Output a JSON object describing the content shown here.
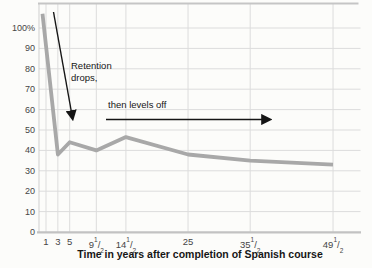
{
  "chart_data": {
    "type": "line",
    "title": "",
    "xlabel": "Time in years after completion of Spanish course",
    "ylabel": "",
    "series": [
      {
        "name": "Percentage of original vocabulary retained",
        "points": [
          {
            "x": 0.4,
            "y": 107
          },
          {
            "x": 3,
            "y": 38
          },
          {
            "x": 5,
            "y": 44
          },
          {
            "x": 9.5,
            "y": 40
          },
          {
            "x": 14.5,
            "y": 46.5
          },
          {
            "x": 25,
            "y": 38
          },
          {
            "x": 35.5,
            "y": 35
          },
          {
            "x": 49.5,
            "y": 33
          }
        ]
      }
    ],
    "x_ticks": [
      {
        "v": 1,
        "label": "1"
      },
      {
        "v": 3,
        "label": "3"
      },
      {
        "v": 5,
        "label": "5"
      },
      {
        "v": 9.5,
        "label": "9 1/2"
      },
      {
        "v": 14.5,
        "label": "14 1/2"
      },
      {
        "v": 25,
        "label": "25"
      },
      {
        "v": 35.5,
        "label": "35 1/2"
      },
      {
        "v": 49.5,
        "label": "49 1/2"
      }
    ],
    "y_ticks": [
      {
        "v": 100,
        "label": "100%"
      },
      {
        "v": 90,
        "label": "90"
      },
      {
        "v": 80,
        "label": "80"
      },
      {
        "v": 70,
        "label": "70"
      },
      {
        "v": 60,
        "label": "60"
      },
      {
        "v": 50,
        "label": "50"
      },
      {
        "v": 40,
        "label": "40"
      },
      {
        "v": 30,
        "label": "30"
      },
      {
        "v": 20,
        "label": "20"
      },
      {
        "v": 10,
        "label": "10"
      },
      {
        "v": 0,
        "label": "0"
      }
    ],
    "xlim": [
      0,
      54
    ],
    "ylim": [
      0,
      112
    ],
    "grid": true,
    "legend": "none"
  },
  "annotations": {
    "retention_line1": "Retention",
    "retention_line2": "drops,",
    "levels": "then levels off"
  },
  "colors": {
    "background": "#fcfcfa",
    "gridline": "#dcdcdc",
    "frame": "#c5c5c5",
    "axis": "#c2c2c2",
    "curve": "#a8a8a8",
    "tick_text": "#454545",
    "annotation_text": "#161616",
    "arrow": "#151515"
  }
}
